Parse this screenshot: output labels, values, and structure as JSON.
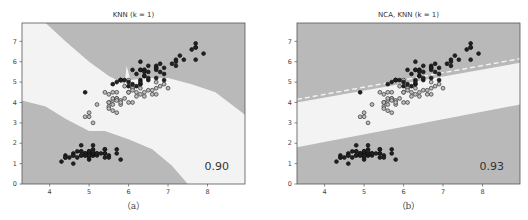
{
  "chart_data": [
    {
      "type": "scatter",
      "id": "a",
      "title": "KNN (k = 1)",
      "caption": "（a）",
      "score_label": "0.90",
      "xlabel": "",
      "ylabel": "",
      "xlim": [
        3.3,
        8.95
      ],
      "ylim": [
        0,
        7.9
      ],
      "x_ticks": [
        "4",
        "5",
        "6",
        "7",
        "8"
      ],
      "x_tick_values": [
        4,
        5,
        6,
        7,
        8
      ],
      "y_ticks": [
        "0",
        "1",
        "2",
        "3",
        "4",
        "5",
        "6",
        "7"
      ],
      "y_tick_values": [
        0,
        1,
        2,
        3,
        4,
        5,
        6,
        7
      ],
      "grid": false,
      "background_regions": "decision regions: dark gray (class 0, lower-left), white band (class 1), dark gray (class 2, upper-right); curved boundaries"
    },
    {
      "type": "scatter",
      "id": "b",
      "title": "NCA, KNN (k = 1)",
      "caption": "（b）",
      "score_label": "0.93",
      "xlabel": "",
      "ylabel": "",
      "xlim": [
        3.3,
        8.95
      ],
      "ylim": [
        0,
        7.9
      ],
      "x_ticks": [
        "4",
        "5",
        "6",
        "7",
        "8"
      ],
      "x_tick_values": [
        4,
        5,
        6,
        7,
        8
      ],
      "y_ticks": [
        "0",
        "1",
        "2",
        "3",
        "4",
        "5",
        "6",
        "7"
      ],
      "y_tick_values": [
        0,
        1,
        2,
        3,
        4,
        5,
        6,
        7
      ],
      "grid": false,
      "background_regions": "decision regions: dark gray (class 0, bottom), white band (class 1), dark gray (class 2, top); straight linear boundaries"
    }
  ],
  "series": [
    {
      "name": "class-0",
      "style": "filled-dark",
      "points": [
        [
          5.1,
          1.4
        ],
        [
          4.9,
          1.4
        ],
        [
          4.7,
          1.3
        ],
        [
          4.6,
          1.5
        ],
        [
          5.0,
          1.4
        ],
        [
          5.4,
          1.7
        ],
        [
          4.6,
          1.4
        ],
        [
          5.0,
          1.5
        ],
        [
          4.4,
          1.4
        ],
        [
          4.9,
          1.5
        ],
        [
          5.4,
          1.5
        ],
        [
          4.8,
          1.6
        ],
        [
          4.8,
          1.4
        ],
        [
          4.3,
          1.1
        ],
        [
          5.8,
          1.2
        ],
        [
          5.7,
          1.5
        ],
        [
          5.4,
          1.3
        ],
        [
          5.1,
          1.4
        ],
        [
          5.7,
          1.7
        ],
        [
          5.1,
          1.5
        ],
        [
          5.4,
          1.7
        ],
        [
          5.1,
          1.5
        ],
        [
          4.6,
          1.0
        ],
        [
          5.1,
          1.7
        ],
        [
          4.8,
          1.9
        ],
        [
          5.0,
          1.6
        ],
        [
          5.0,
          1.6
        ],
        [
          5.2,
          1.5
        ],
        [
          5.2,
          1.4
        ],
        [
          4.7,
          1.6
        ],
        [
          4.8,
          1.6
        ],
        [
          5.4,
          1.5
        ],
        [
          5.2,
          1.5
        ],
        [
          5.5,
          1.4
        ],
        [
          4.9,
          1.5
        ],
        [
          5.0,
          1.2
        ],
        [
          5.5,
          1.3
        ],
        [
          4.9,
          1.4
        ],
        [
          4.4,
          1.3
        ],
        [
          5.1,
          1.5
        ],
        [
          5.0,
          1.3
        ],
        [
          4.5,
          1.3
        ],
        [
          4.4,
          1.3
        ],
        [
          5.0,
          1.6
        ],
        [
          5.1,
          1.9
        ],
        [
          4.8,
          1.4
        ],
        [
          5.1,
          1.6
        ],
        [
          4.6,
          1.4
        ],
        [
          5.3,
          1.5
        ],
        [
          5.0,
          1.4
        ]
      ]
    },
    {
      "name": "class-1",
      "style": "open-circle",
      "points": [
        [
          7.0,
          4.7
        ],
        [
          6.4,
          4.5
        ],
        [
          6.9,
          4.9
        ],
        [
          5.5,
          4.0
        ],
        [
          6.5,
          4.6
        ],
        [
          5.7,
          4.5
        ],
        [
          6.3,
          4.7
        ],
        [
          4.9,
          3.3
        ],
        [
          6.6,
          4.6
        ],
        [
          5.2,
          3.9
        ],
        [
          5.0,
          3.5
        ],
        [
          5.9,
          4.2
        ],
        [
          6.0,
          4.0
        ],
        [
          6.1,
          4.7
        ],
        [
          5.6,
          3.6
        ],
        [
          6.7,
          4.4
        ],
        [
          5.6,
          4.5
        ],
        [
          5.8,
          4.1
        ],
        [
          6.2,
          4.5
        ],
        [
          5.6,
          3.9
        ],
        [
          5.9,
          4.8
        ],
        [
          6.1,
          4.0
        ],
        [
          6.3,
          4.9
        ],
        [
          6.1,
          4.7
        ],
        [
          6.4,
          4.3
        ],
        [
          6.6,
          4.4
        ],
        [
          6.8,
          4.8
        ],
        [
          6.7,
          5.0
        ],
        [
          6.0,
          4.5
        ],
        [
          5.7,
          3.5
        ],
        [
          5.5,
          3.8
        ],
        [
          5.5,
          3.7
        ],
        [
          5.8,
          3.9
        ],
        [
          6.0,
          5.1
        ],
        [
          5.4,
          4.5
        ],
        [
          6.0,
          4.5
        ],
        [
          6.7,
          4.7
        ],
        [
          6.3,
          4.4
        ],
        [
          5.6,
          4.1
        ],
        [
          5.5,
          4.0
        ],
        [
          5.5,
          4.4
        ],
        [
          6.1,
          4.6
        ],
        [
          5.8,
          4.0
        ],
        [
          5.0,
          3.3
        ],
        [
          5.6,
          4.2
        ],
        [
          5.7,
          4.2
        ],
        [
          5.7,
          4.2
        ],
        [
          6.2,
          4.3
        ],
        [
          5.1,
          3.0
        ],
        [
          5.7,
          4.1
        ]
      ]
    },
    {
      "name": "class-2",
      "style": "filled-dark",
      "points": [
        [
          6.3,
          6.0
        ],
        [
          5.8,
          5.1
        ],
        [
          7.1,
          5.9
        ],
        [
          6.3,
          5.6
        ],
        [
          6.5,
          5.8
        ],
        [
          7.6,
          6.6
        ],
        [
          4.9,
          4.5
        ],
        [
          7.3,
          6.3
        ],
        [
          6.7,
          5.8
        ],
        [
          7.2,
          6.1
        ],
        [
          6.5,
          5.1
        ],
        [
          6.4,
          5.3
        ],
        [
          6.8,
          5.5
        ],
        [
          5.7,
          5.0
        ],
        [
          5.8,
          5.1
        ],
        [
          6.4,
          5.3
        ],
        [
          6.5,
          5.5
        ],
        [
          7.7,
          6.7
        ],
        [
          7.7,
          6.9
        ],
        [
          6.0,
          5.0
        ],
        [
          6.9,
          5.7
        ],
        [
          5.6,
          4.9
        ],
        [
          7.7,
          6.7
        ],
        [
          6.3,
          4.9
        ],
        [
          6.7,
          5.7
        ],
        [
          7.2,
          6.0
        ],
        [
          6.2,
          4.8
        ],
        [
          6.1,
          4.9
        ],
        [
          6.4,
          5.6
        ],
        [
          7.2,
          5.8
        ],
        [
          7.4,
          6.1
        ],
        [
          7.9,
          6.4
        ],
        [
          6.4,
          5.6
        ],
        [
          6.3,
          5.1
        ],
        [
          6.1,
          5.6
        ],
        [
          7.7,
          6.1
        ],
        [
          6.3,
          5.6
        ],
        [
          6.4,
          5.5
        ],
        [
          6.0,
          4.8
        ],
        [
          6.9,
          5.4
        ],
        [
          6.7,
          5.6
        ],
        [
          6.9,
          5.1
        ],
        [
          5.8,
          5.1
        ],
        [
          6.8,
          5.9
        ],
        [
          6.7,
          5.7
        ],
        [
          6.7,
          5.2
        ],
        [
          6.3,
          5.0
        ],
        [
          6.5,
          5.2
        ],
        [
          6.2,
          5.4
        ],
        [
          5.9,
          5.1
        ]
      ]
    }
  ]
}
